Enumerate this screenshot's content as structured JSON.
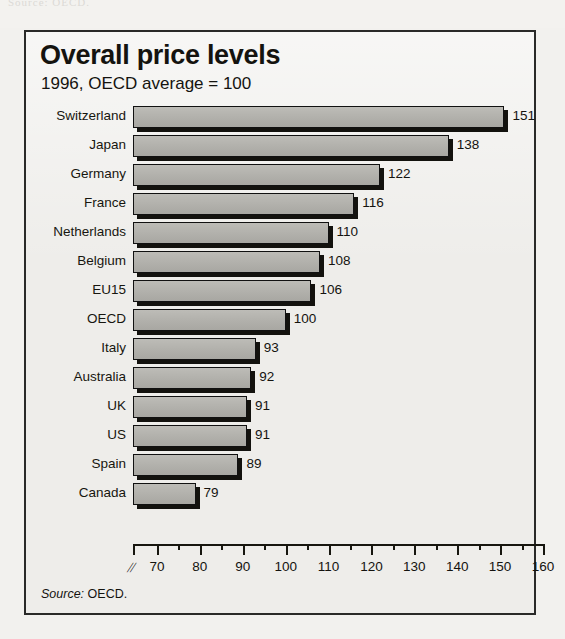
{
  "figure": {
    "title": "Overall price levels",
    "subtitle": "1996, OECD average = 100",
    "source_label": "Source:",
    "source_value": "OECD.",
    "axis_break_glyph": "//"
  },
  "chart_data": {
    "type": "bar",
    "orientation": "horizontal",
    "title": "Overall price levels",
    "subtitle": "1996, OECD average = 100",
    "xlabel": "",
    "ylabel": "",
    "xlim": [
      70,
      160
    ],
    "axis_break": true,
    "grid": false,
    "legend": null,
    "tick_step_major": 10,
    "tick_step_minor": 5,
    "xticks": [
      70,
      80,
      90,
      100,
      110,
      120,
      130,
      140,
      150,
      160
    ],
    "xticklabels": [
      "70",
      "80",
      "90",
      "100",
      "110",
      "120",
      "130",
      "140",
      "150",
      "160"
    ],
    "categories": [
      "Switzerland",
      "Japan",
      "Germany",
      "France",
      "Netherlands",
      "Belgium",
      "EU15",
      "OECD",
      "Italy",
      "Australia",
      "UK",
      "US",
      "Spain",
      "Canada"
    ],
    "values": [
      151,
      138,
      122,
      116,
      110,
      108,
      106,
      100,
      93,
      92,
      91,
      91,
      89,
      79
    ],
    "value_labels": [
      "151",
      "138",
      "122",
      "116",
      "110",
      "108",
      "106",
      "100",
      "93",
      "92",
      "91",
      "91",
      "89",
      "79"
    ],
    "bar_color": "#b3b2ad",
    "bar_edge_color": "#111111",
    "shadow_color": "#13120e",
    "background_color": "#eeedea"
  }
}
